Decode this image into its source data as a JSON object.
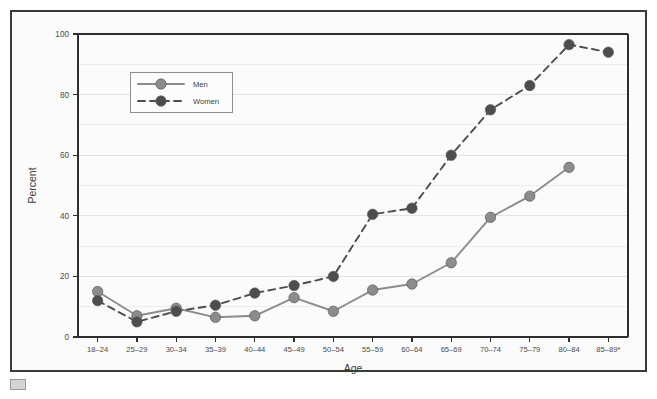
{
  "chart_data": {
    "type": "line",
    "title": "",
    "xlabel": "Age",
    "ylabel": "Percent",
    "ylim": [
      0,
      100
    ],
    "yticks": [
      0,
      20,
      40,
      60,
      80,
      100
    ],
    "ytick_labels": [
      "0",
      "20",
      "40",
      "60",
      "80",
      "100"
    ],
    "grid": true,
    "grid_minor_step": 10,
    "legend_position": "upper-left-inside",
    "categories": [
      "18–24",
      "25–29",
      "30–34",
      "35–39",
      "40–44",
      "45–49",
      "50–54",
      "55–59",
      "60–64",
      "65–69",
      "70–74",
      "75–79",
      "80–84",
      "85–89*"
    ],
    "series": [
      {
        "name": "Men",
        "color": "#8c8c8c",
        "marker_color": "#8c8c8c",
        "line_style": "solid",
        "values": [
          15,
          7,
          9.5,
          6.5,
          7,
          13,
          8.5,
          15.5,
          17.5,
          24.5,
          39.5,
          46.5,
          56,
          null
        ]
      },
      {
        "name": "Women",
        "color": "#4d4d4d",
        "marker_color": "#4d4d4d",
        "line_style": "dashed",
        "values": [
          12,
          5,
          8.5,
          10.5,
          14.5,
          17,
          20,
          40.5,
          42.5,
          60,
          75,
          83,
          96.5,
          94
        ]
      }
    ]
  },
  "legend": {
    "items": [
      {
        "label": "Men"
      },
      {
        "label": "Women"
      }
    ]
  },
  "footnote_marker": "*"
}
